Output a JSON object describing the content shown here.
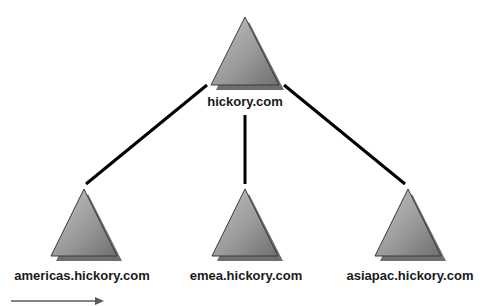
{
  "diagram": {
    "type": "domain-tree",
    "root": {
      "label": "hickory.com",
      "apex": [
        245,
        17
      ],
      "base_y": 85,
      "half_width": 34,
      "label_pos": [
        245,
        106
      ]
    },
    "children": [
      {
        "label": "americas.hickory.com",
        "apex": [
          84,
          189
        ],
        "base_y": 256,
        "half_width": 33,
        "label_pos": [
          82,
          280
        ],
        "connector": [
          [
            207,
            85
          ],
          [
            86,
            184
          ]
        ]
      },
      {
        "label": "emea.hickory.com",
        "apex": [
          245,
          189
        ],
        "base_y": 256,
        "half_width": 33,
        "label_pos": [
          246,
          280
        ],
        "connector": [
          [
            245,
            115
          ],
          [
            245,
            184
          ]
        ]
      },
      {
        "label": "asiapac.hickory.com",
        "apex": [
          408,
          189
        ],
        "base_y": 256,
        "half_width": 33,
        "label_pos": [
          410,
          280
        ],
        "connector": [
          [
            284,
            85
          ],
          [
            405,
            184
          ]
        ]
      }
    ],
    "arrow": {
      "from": [
        11,
        301
      ],
      "to": [
        104,
        301
      ]
    },
    "colors": {
      "triangle_top": "#b8b8b8",
      "triangle_bottom": "#7a7a7a",
      "triangle_edge": "#3a3a3a",
      "shadow": "#6e6e6e",
      "connector": "#000000",
      "arrow": "#5a5a5a",
      "text": "#1a1a1a"
    }
  }
}
